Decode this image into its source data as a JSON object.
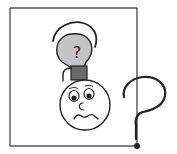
{
  "illustration": {
    "description": "Confused face with a light bulb containing a question mark above its head, inside a square frame, with a large question mark outside the frame",
    "bulb_symbol": "?",
    "colors": {
      "frame": "#555555",
      "outline": "#222222",
      "bulb_fill": "#c4c4c4",
      "bulb_base": "#6a6a6a",
      "face_fill": "#ffffff",
      "background": "#ffffff"
    }
  }
}
